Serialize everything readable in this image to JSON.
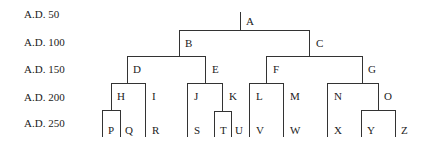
{
  "timeline": {
    "labels": [
      "A.D. 50",
      "A.D. 100",
      "A.D. 150",
      "A.D. 200",
      "A.D. 250"
    ]
  },
  "tree": {
    "root": "A",
    "edges": [
      [
        "A",
        "B"
      ],
      [
        "A",
        "C"
      ],
      [
        "B",
        "D"
      ],
      [
        "B",
        "E"
      ],
      [
        "C",
        "F"
      ],
      [
        "C",
        "G"
      ],
      [
        "D",
        "H"
      ],
      [
        "D",
        "I"
      ],
      [
        "E",
        "J"
      ],
      [
        "E",
        "K"
      ],
      [
        "F",
        "L"
      ],
      [
        "F",
        "M"
      ],
      [
        "G",
        "N"
      ],
      [
        "G",
        "O"
      ],
      [
        "H",
        "P"
      ],
      [
        "H",
        "Q"
      ],
      [
        "I",
        "R"
      ],
      [
        "J",
        "S"
      ],
      [
        "K",
        "T"
      ],
      [
        "K",
        "U"
      ],
      [
        "L",
        "V"
      ],
      [
        "M",
        "W"
      ],
      [
        "N",
        "X"
      ],
      [
        "O",
        "Y"
      ],
      [
        "O",
        "Z"
      ]
    ],
    "nodes": {
      "A": "A",
      "B": "B",
      "C": "C",
      "D": "D",
      "E": "E",
      "F": "F",
      "G": "G",
      "H": "H",
      "I": "I",
      "J": "J",
      "K": "K",
      "L": "L",
      "M": "M",
      "N": "N",
      "O": "O",
      "P": "P",
      "Q": "Q",
      "R": "R",
      "S": "S",
      "T": "T",
      "U": "U",
      "V": "V",
      "W": "W",
      "X": "X",
      "Y": "Y",
      "Z": "Z"
    }
  },
  "colors": {
    "line": "#333333",
    "text": "#222222",
    "background": "#ffffff"
  }
}
